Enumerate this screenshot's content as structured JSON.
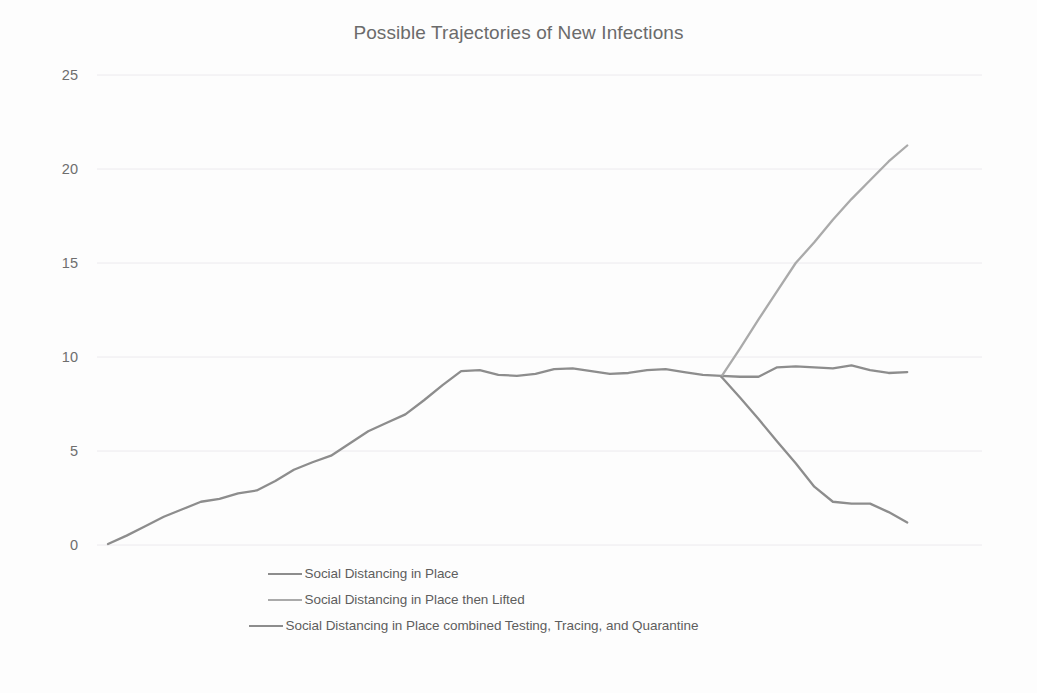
{
  "chart_data": {
    "type": "line",
    "title": "Possible Trajectories of New Infections",
    "xlabel": "",
    "ylabel": "",
    "ylim": [
      0,
      25
    ],
    "yticks": [
      0,
      5,
      10,
      15,
      20,
      25
    ],
    "ytick_labels": [
      "0",
      "5",
      "10",
      "15",
      "20",
      "25"
    ],
    "xlim": [
      0,
      46
    ],
    "grid": "horizontal",
    "legend_position": "bottom-center",
    "x_axis_visible": false,
    "series": [
      {
        "name": "Social Distancing in Place",
        "color": "#8d8d8d",
        "x": [
          0,
          1,
          2,
          3,
          4,
          5,
          6,
          7,
          8,
          9,
          10,
          11,
          12,
          13,
          14,
          15,
          16,
          17,
          18,
          19,
          20,
          21,
          22,
          23,
          24,
          25,
          26,
          27,
          28,
          29,
          30,
          31,
          32,
          33,
          34,
          35,
          36,
          37,
          38,
          39,
          40,
          41,
          42,
          43
        ],
        "y": [
          0.05,
          0.5,
          1.0,
          1.5,
          1.9,
          2.3,
          2.45,
          2.75,
          2.9,
          3.4,
          4.0,
          4.4,
          4.75,
          5.4,
          6.05,
          6.5,
          6.95,
          7.7,
          8.5,
          9.25,
          9.3,
          9.05,
          9.0,
          9.1,
          9.35,
          9.4,
          9.25,
          9.1,
          9.15,
          9.3,
          9.35,
          9.2,
          9.05,
          9.0,
          8.95,
          8.95,
          9.45,
          9.5,
          9.45,
          9.4,
          9.55,
          9.3,
          9.15,
          9.2
        ]
      },
      {
        "name": "Social Distancing in Place then Lifted",
        "color": "#aaaaaa",
        "x": [
          33,
          34,
          35,
          36,
          37,
          38,
          39,
          40,
          41,
          42,
          43
        ],
        "y": [
          8.95,
          10.45,
          12.0,
          13.5,
          15.0,
          16.1,
          17.3,
          18.4,
          19.4,
          20.4,
          21.25
        ]
      },
      {
        "name": "Social Distancing in Place combined Testing, Tracing, and Quarantine",
        "color": "#8d8d8d",
        "x": [
          33,
          34,
          35,
          36,
          37,
          38,
          39,
          40,
          41,
          42,
          43
        ],
        "y": [
          8.95,
          7.85,
          6.7,
          5.5,
          4.35,
          3.1,
          2.3,
          2.2,
          2.2,
          1.75,
          1.2
        ]
      }
    ]
  },
  "legend": {
    "items": [
      {
        "label": "Social Distancing in Place",
        "color": "#8d8d8d"
      },
      {
        "label": "Social Distancing in Place then Lifted",
        "color": "#aaaaaa"
      },
      {
        "label": "Social Distancing in Place combined Testing, Tracing, and Quarantine",
        "color": "#8d8d8d"
      }
    ]
  }
}
